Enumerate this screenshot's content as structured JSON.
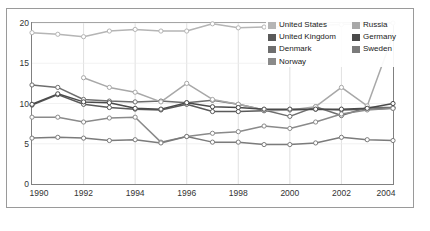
{
  "chart_data": {
    "type": "line",
    "title": "",
    "xlabel": "",
    "ylabel": "",
    "x": [
      1990,
      1991,
      1992,
      1993,
      1994,
      1995,
      1996,
      1997,
      1998,
      1999,
      2000,
      2001,
      2002,
      2003,
      2004
    ],
    "xlim": [
      1990,
      2004
    ],
    "ylim": [
      0,
      20
    ],
    "yticks": [
      0,
      5,
      10,
      15,
      20
    ],
    "xticks": [
      1990,
      1992,
      1994,
      1996,
      1998,
      2000,
      2002,
      2004
    ],
    "xticklabels": [
      "1990",
      "1992",
      "1994",
      "1996",
      "1998",
      "2000",
      "2002",
      "2004"
    ],
    "yticklabels": [
      "0",
      "5",
      "10",
      "15",
      "20"
    ],
    "grid": "vertical-only",
    "legend_position": "upper-right-inside",
    "marker": "open-circle",
    "series": [
      {
        "name": "United States",
        "color": "#b5b5b5",
        "values": [
          18.8,
          18.6,
          18.3,
          19.0,
          19.2,
          19.0,
          19.0,
          19.9,
          19.4,
          19.5,
          19.6,
          19.7,
          19.8,
          19.9,
          20.0
        ]
      },
      {
        "name": "United Kingdom",
        "color": "#5a5a5a",
        "values": [
          9.8,
          11.1,
          9.9,
          9.5,
          9.3,
          9.2,
          9.9,
          9.0,
          9.0,
          9.1,
          9.2,
          9.3,
          9.2,
          9.3,
          9.4
        ]
      },
      {
        "name": "Denmark",
        "color": "#6e6e6e",
        "values": [
          12.3,
          12.0,
          10.5,
          10.3,
          10.2,
          10.3,
          10.1,
          10.4,
          9.9,
          9.2,
          8.4,
          9.6,
          8.5,
          9.5,
          9.5
        ]
      },
      {
        "name": "Norway",
        "color": "#8a8a8a",
        "values": [
          8.3,
          8.3,
          7.7,
          8.2,
          8.3,
          5.2,
          5.9,
          6.3,
          6.5,
          7.2,
          6.9,
          7.7,
          8.7,
          9.2,
          9.4
        ]
      },
      {
        "name": "Russia",
        "color": "#a8a8a8",
        "values": [
          null,
          null,
          13.2,
          12.0,
          11.4,
          10.2,
          12.5,
          10.5,
          9.9,
          9.2,
          9.2,
          9.6,
          12.0,
          9.7,
          18.5
        ]
      },
      {
        "name": "Germany",
        "color": "#4a4a4a",
        "values": [
          9.9,
          11.2,
          10.2,
          10.1,
          9.4,
          9.3,
          10.1,
          9.6,
          9.5,
          9.3,
          9.3,
          9.3,
          9.3,
          9.4,
          10.0
        ]
      },
      {
        "name": "Sweden",
        "color": "#7b7b7b",
        "values": [
          5.7,
          5.8,
          5.7,
          5.4,
          5.5,
          5.1,
          5.9,
          5.2,
          5.2,
          4.9,
          4.9,
          5.1,
          5.8,
          5.5,
          5.4
        ]
      }
    ]
  },
  "legend": {
    "items": [
      {
        "label": "United States",
        "series": 0
      },
      {
        "label": "Russia",
        "series": 4
      },
      {
        "label": "United Kingdom",
        "series": 1
      },
      {
        "label": "Germany",
        "series": 5
      },
      {
        "label": "Denmark",
        "series": 2
      },
      {
        "label": "Sweden",
        "series": 6
      },
      {
        "label": "Norway",
        "series": 3
      }
    ]
  },
  "colors": {
    "axis": "#808080",
    "frame": "#9a9a9a",
    "grid": "#d8d8d8",
    "marker_fill": "#ffffff",
    "text": "#333333",
    "background": "#ffffff"
  }
}
